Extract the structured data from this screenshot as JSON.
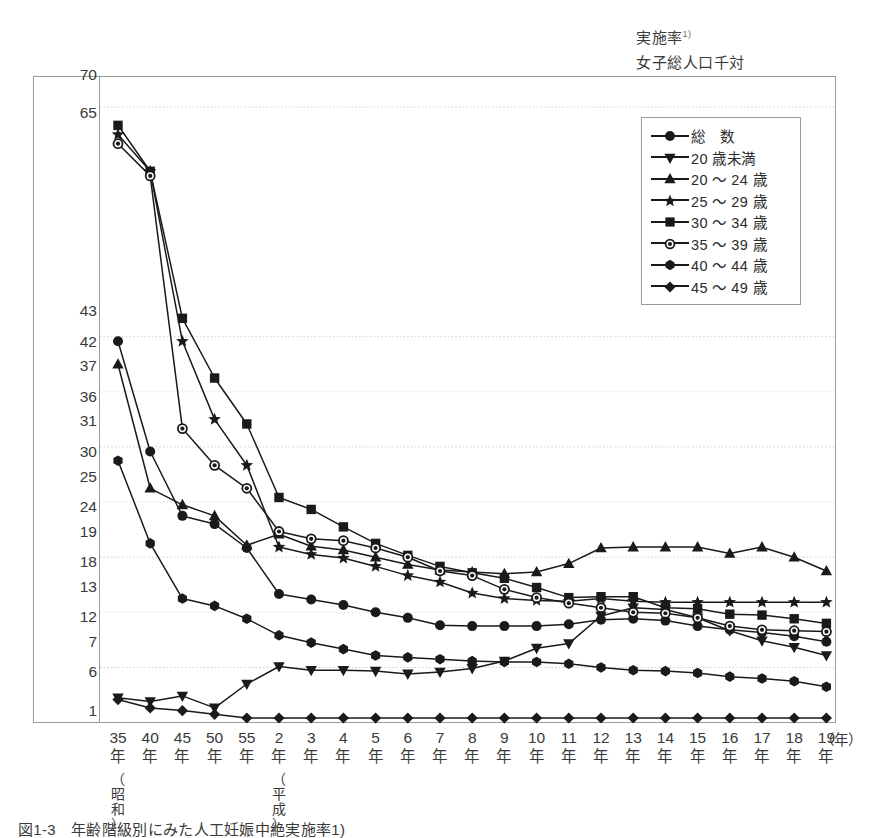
{
  "header": {
    "unit_label": "実施率",
    "unit_footnote": "1)",
    "unit_denominator": "女子総人口千対"
  },
  "caption": {
    "text": "図1-3　年齢階級別にみた人工妊娠中絶実施率1)"
  },
  "axis": {
    "x_unit": "（年）",
    "era_showa": "（昭和）",
    "era_heisei": "（平成）",
    "y_tick_labels": [
      "70",
      "65",
      "43",
      "42",
      "37",
      "36",
      "31",
      "30",
      "25",
      "24",
      "19",
      "18",
      "13",
      "12",
      "7",
      "6",
      "1"
    ],
    "x_tick_labels": [
      {
        "num": "35",
        "nen": "年"
      },
      {
        "num": "40",
        "nen": "年"
      },
      {
        "num": "45",
        "nen": "年"
      },
      {
        "num": "50",
        "nen": "年"
      },
      {
        "num": "55",
        "nen": "年"
      },
      {
        "num": "2",
        "nen": "年"
      },
      {
        "num": "3",
        "nen": "年"
      },
      {
        "num": "4",
        "nen": "年"
      },
      {
        "num": "5",
        "nen": "年"
      },
      {
        "num": "6",
        "nen": "年"
      },
      {
        "num": "7",
        "nen": "年"
      },
      {
        "num": "8",
        "nen": "年"
      },
      {
        "num": "9",
        "nen": "年"
      },
      {
        "num": "10",
        "nen": "年"
      },
      {
        "num": "11",
        "nen": "年"
      },
      {
        "num": "12",
        "nen": "年"
      },
      {
        "num": "13",
        "nen": "年"
      },
      {
        "num": "14",
        "nen": "年"
      },
      {
        "num": "15",
        "nen": "年"
      },
      {
        "num": "16",
        "nen": "年"
      },
      {
        "num": "17",
        "nen": "年"
      },
      {
        "num": "18",
        "nen": "年"
      },
      {
        "num": "19",
        "nen": "年"
      }
    ]
  },
  "legend": {
    "items": [
      {
        "label": "総　数",
        "marker": "circle"
      },
      {
        "label": "20 歳未満",
        "marker": "triangle-down"
      },
      {
        "label": "20 ～ 24 歳",
        "marker": "triangle-up"
      },
      {
        "label": "25 ～ 29 歳",
        "marker": "star"
      },
      {
        "label": "30 ～ 34 歳",
        "marker": "square"
      },
      {
        "label": "35 ～ 39 歳",
        "marker": "circle-ring"
      },
      {
        "label": "40 ～ 44 歳",
        "marker": "hexagon"
      },
      {
        "label": "45 ～ 49 歳",
        "marker": "diamond"
      }
    ]
  },
  "chart_data": {
    "type": "line",
    "title": "年齢階級別にみた人工妊娠中絶実施率",
    "xlabel": "（年）",
    "ylabel": "実施率（女子総人口千対）",
    "ylim": [
      1,
      70
    ],
    "grid": true,
    "legend_position": "top-right",
    "x": [
      "昭35",
      "昭40",
      "昭45",
      "昭50",
      "昭55",
      "平2",
      "平3",
      "平4",
      "平5",
      "平6",
      "平7",
      "平8",
      "平9",
      "平10",
      "平11",
      "平12",
      "平13",
      "平14",
      "平15",
      "平16",
      "平17",
      "平18",
      "平19"
    ],
    "series": [
      {
        "name": "総　数",
        "marker": "circle",
        "values": [
          42.0,
          30.0,
          23.0,
          22.1,
          19.5,
          14.5,
          13.9,
          13.3,
          12.5,
          11.9,
          11.1,
          11.0,
          11.0,
          11.0,
          11.2,
          11.7,
          11.8,
          11.6,
          11.0,
          10.6,
          10.3,
          9.9,
          9.3
        ]
      },
      {
        "name": "20 歳未満",
        "marker": "triangle-down",
        "values": [
          3.2,
          2.8,
          3.4,
          2.1,
          4.7,
          6.6,
          6.2,
          6.2,
          6.1,
          5.8,
          6.0,
          6.4,
          7.2,
          8.6,
          9.1,
          12.1,
          13.0,
          12.8,
          11.9,
          10.5,
          9.4,
          8.7,
          7.8
        ]
      },
      {
        "name": "20 ～ 24 歳",
        "marker": "triangle-up",
        "values": [
          39.5,
          26.0,
          24.2,
          23.0,
          19.8,
          21.0,
          19.7,
          19.3,
          18.5,
          17.7,
          17.1,
          16.9,
          16.7,
          16.9,
          17.8,
          19.5,
          19.6,
          19.6,
          19.6,
          18.9,
          19.6,
          18.5,
          17.0
        ]
      },
      {
        "name": "25 ～ 29 歳",
        "marker": "star",
        "values": [
          64.5,
          60.5,
          42.0,
          33.5,
          28.5,
          19.6,
          18.8,
          18.4,
          17.5,
          16.5,
          15.8,
          14.6,
          14.0,
          13.8,
          13.7,
          14.0,
          13.7,
          13.6,
          13.6,
          13.6,
          13.6,
          13.6,
          13.6
        ]
      },
      {
        "name": "30 ～ 34 歳",
        "marker": "square",
        "values": [
          65.5,
          60.5,
          44.5,
          38.0,
          33.0,
          25.0,
          23.7,
          21.8,
          20.0,
          18.7,
          17.5,
          16.8,
          16.2,
          15.2,
          14.1,
          14.2,
          14.2,
          13.0,
          12.9,
          12.3,
          12.2,
          11.8,
          11.3
        ]
      },
      {
        "name": "35 ～ 39 歳",
        "marker": "circle-ring",
        "values": [
          63.5,
          60.0,
          32.5,
          28.5,
          26.0,
          21.3,
          20.5,
          20.3,
          19.5,
          18.5,
          17.0,
          16.5,
          15.0,
          14.1,
          13.5,
          13.0,
          12.5,
          12.4,
          11.9,
          11.0,
          10.6,
          10.5,
          10.4
        ]
      },
      {
        "name": "40 ～ 44 歳",
        "marker": "hexagon",
        "values": [
          29.0,
          20.0,
          14.0,
          13.2,
          11.8,
          10.0,
          9.2,
          8.5,
          7.8,
          7.6,
          7.4,
          7.2,
          7.1,
          7.1,
          6.9,
          6.5,
          6.2,
          6.1,
          5.9,
          5.5,
          5.3,
          5.0,
          4.4
        ]
      },
      {
        "name": "45 ～ 49 歳",
        "marker": "diamond",
        "values": [
          3.0,
          2.1,
          1.8,
          1.4,
          1.0,
          1.0,
          1.0,
          1.0,
          1.0,
          1.0,
          1.0,
          1.0,
          1.0,
          1.0,
          1.0,
          1.0,
          1.0,
          1.0,
          1.0,
          1.0,
          1.0,
          1.0,
          1.0
        ]
      }
    ],
    "y_gridline_values": [
      67.5,
      42.5,
      36.5,
      30.5,
      24.5,
      18.5,
      12.5,
      6.5
    ]
  },
  "geometry": {
    "plot_left": 100,
    "plot_right": 836,
    "plot_top": 77,
    "plot_bottom": 722,
    "x_first": 118,
    "x_step": 32.2,
    "y_for_70": 84,
    "y_for_1": 718
  }
}
